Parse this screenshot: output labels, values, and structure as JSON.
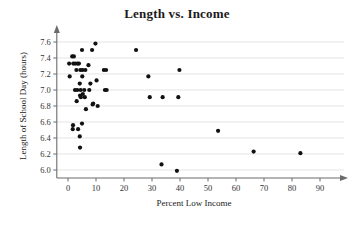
{
  "chart_data": {
    "type": "scatter",
    "title": "Length vs. Income",
    "xlabel": "Percent Low Income",
    "ylabel": "Length of School Day (hours)",
    "xlim": [
      -5,
      95
    ],
    "ylim": [
      5.88,
      7.7
    ],
    "xticks": [
      0,
      10,
      20,
      30,
      40,
      50,
      60,
      70,
      80,
      90
    ],
    "xtick_labels": [
      "0",
      "10",
      "20",
      "30",
      "40",
      "50",
      "60",
      "70",
      "80",
      "90"
    ],
    "yticks": [
      6.0,
      6.2,
      6.4,
      6.6,
      6.8,
      7.0,
      7.2,
      7.4,
      7.6
    ],
    "ytick_labels": [
      "6.0",
      "6.2",
      "6.4",
      "6.6",
      "6.8",
      "7.0",
      "7.2",
      "7.4",
      "7.6"
    ],
    "grid": true,
    "grid_axis": "y",
    "legend": null,
    "marker": "filled-circle",
    "marker_color": "#111111",
    "points": [
      {
        "x": 0.4,
        "y": 7.33
      },
      {
        "x": 0.6,
        "y": 7.17
      },
      {
        "x": 1.5,
        "y": 7.42
      },
      {
        "x": 2.1,
        "y": 7.42
      },
      {
        "x": 1.9,
        "y": 7.33
      },
      {
        "x": 2.6,
        "y": 7.33
      },
      {
        "x": 1.8,
        "y": 6.56
      },
      {
        "x": 1.7,
        "y": 6.51
      },
      {
        "x": 2.5,
        "y": 7.0
      },
      {
        "x": 3.0,
        "y": 7.25
      },
      {
        "x": 3.4,
        "y": 7.33
      },
      {
        "x": 3.9,
        "y": 7.33
      },
      {
        "x": 3.3,
        "y": 7.0
      },
      {
        "x": 3.1,
        "y": 6.86
      },
      {
        "x": 3.6,
        "y": 6.51
      },
      {
        "x": 4.2,
        "y": 7.08
      },
      {
        "x": 4.4,
        "y": 7.25
      },
      {
        "x": 4.5,
        "y": 7.0
      },
      {
        "x": 4.3,
        "y": 6.93
      },
      {
        "x": 4.6,
        "y": 6.91
      },
      {
        "x": 4.2,
        "y": 6.42
      },
      {
        "x": 4.3,
        "y": 6.28
      },
      {
        "x": 5.0,
        "y": 7.5
      },
      {
        "x": 5.2,
        "y": 7.25
      },
      {
        "x": 5.1,
        "y": 7.17
      },
      {
        "x": 5.3,
        "y": 6.95
      },
      {
        "x": 5.0,
        "y": 6.58
      },
      {
        "x": 5.8,
        "y": 7.0
      },
      {
        "x": 6.0,
        "y": 6.91
      },
      {
        "x": 6.2,
        "y": 7.25
      },
      {
        "x": 6.4,
        "y": 6.76
      },
      {
        "x": 7.3,
        "y": 7.31
      },
      {
        "x": 7.6,
        "y": 7.0
      },
      {
        "x": 8.0,
        "y": 7.08
      },
      {
        "x": 8.6,
        "y": 7.5
      },
      {
        "x": 9.0,
        "y": 6.83
      },
      {
        "x": 8.8,
        "y": 6.82
      },
      {
        "x": 9.8,
        "y": 7.58
      },
      {
        "x": 10.2,
        "y": 7.12
      },
      {
        "x": 10.6,
        "y": 6.8
      },
      {
        "x": 12.8,
        "y": 7.25
      },
      {
        "x": 13.6,
        "y": 7.25
      },
      {
        "x": 13.2,
        "y": 7.0
      },
      {
        "x": 13.8,
        "y": 7.0
      },
      {
        "x": 24.3,
        "y": 7.5
      },
      {
        "x": 28.7,
        "y": 7.17
      },
      {
        "x": 29.2,
        "y": 6.91
      },
      {
        "x": 33.8,
        "y": 6.91
      },
      {
        "x": 33.4,
        "y": 6.07
      },
      {
        "x": 38.9,
        "y": 5.99
      },
      {
        "x": 39.4,
        "y": 6.91
      },
      {
        "x": 39.8,
        "y": 7.25
      },
      {
        "x": 53.6,
        "y": 6.49
      },
      {
        "x": 66.3,
        "y": 6.23
      },
      {
        "x": 83.0,
        "y": 6.21
      }
    ]
  }
}
